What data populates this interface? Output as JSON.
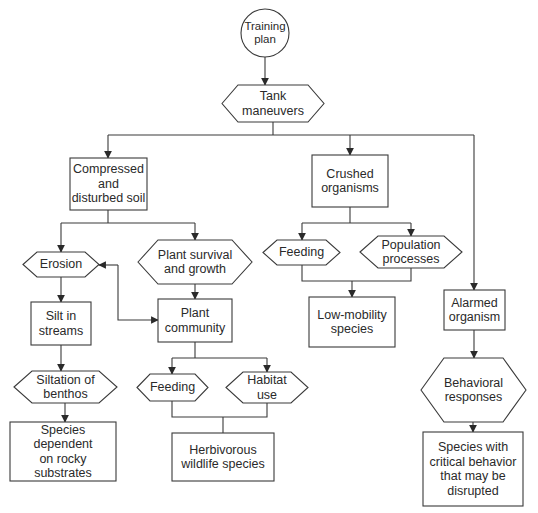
{
  "diagram": {
    "colors": {
      "stroke": "#3a3a3a",
      "text": "#2a2a2a",
      "background": "#ffffff"
    },
    "nodes": {
      "training_plan": {
        "label": "Training\nplan",
        "shape": "circle"
      },
      "tank_maneuvers": {
        "label": "Tank\nmaneuvers",
        "shape": "hexagon"
      },
      "compressed_soil": {
        "label": "Compressed\nand\ndisturbed soil",
        "shape": "rectangle"
      },
      "crushed_organisms": {
        "label": "Crushed\norganisms",
        "shape": "rectangle"
      },
      "erosion": {
        "label": "Erosion",
        "shape": "hexagon"
      },
      "plant_survival": {
        "label": "Plant survival\nand growth",
        "shape": "hexagon"
      },
      "feeding_crushed": {
        "label": "Feeding",
        "shape": "hexagon"
      },
      "population_processes": {
        "label": "Population\nprocesses",
        "shape": "hexagon"
      },
      "silt_streams": {
        "label": "Silt in\nstreams",
        "shape": "rectangle"
      },
      "plant_community": {
        "label": "Plant\ncommunity",
        "shape": "rectangle"
      },
      "low_mobility": {
        "label": "Low-mobility\nspecies",
        "shape": "rectangle"
      },
      "alarmed_organism": {
        "label": "Alarmed\norganism",
        "shape": "rectangle"
      },
      "siltation_benthos": {
        "label": "Siltation of\nbenthos",
        "shape": "hexagon"
      },
      "feeding_plant": {
        "label": "Feeding",
        "shape": "hexagon"
      },
      "habitat_use": {
        "label": "Habitat\nuse",
        "shape": "hexagon"
      },
      "behavioral_responses": {
        "label": "Behavioral\nresponses",
        "shape": "hexagon"
      },
      "species_rocky": {
        "label": "Species dependent\non rocky substrates",
        "shape": "rectangle"
      },
      "herbivorous": {
        "label": "Herbivorous\nwildlife species",
        "shape": "rectangle"
      },
      "species_critical": {
        "label": "Species with\ncritical behavior\nthat may be\ndisrupted",
        "shape": "rectangle"
      }
    },
    "edges": [
      [
        "training_plan",
        "tank_maneuvers"
      ],
      [
        "tank_maneuvers",
        "compressed_soil"
      ],
      [
        "tank_maneuvers",
        "crushed_organisms"
      ],
      [
        "tank_maneuvers",
        "alarmed_organism"
      ],
      [
        "compressed_soil",
        "erosion"
      ],
      [
        "compressed_soil",
        "plant_survival"
      ],
      [
        "erosion",
        "plant_community",
        "bidirectional"
      ],
      [
        "erosion",
        "silt_streams"
      ],
      [
        "plant_survival",
        "plant_community"
      ],
      [
        "silt_streams",
        "siltation_benthos"
      ],
      [
        "siltation_benthos",
        "species_rocky"
      ],
      [
        "plant_community",
        "feeding_plant"
      ],
      [
        "plant_community",
        "habitat_use"
      ],
      [
        "feeding_plant",
        "herbivorous"
      ],
      [
        "habitat_use",
        "herbivorous"
      ],
      [
        "crushed_organisms",
        "feeding_crushed"
      ],
      [
        "crushed_organisms",
        "population_processes"
      ],
      [
        "feeding_crushed",
        "low_mobility"
      ],
      [
        "population_processes",
        "low_mobility"
      ],
      [
        "alarmed_organism",
        "behavioral_responses"
      ],
      [
        "behavioral_responses",
        "species_critical"
      ]
    ]
  }
}
